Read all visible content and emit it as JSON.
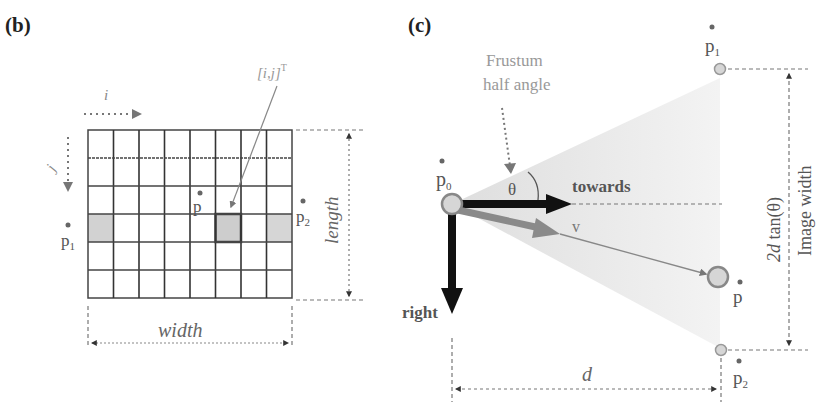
{
  "panels": {
    "b": {
      "label": "(b)",
      "axis_i": "i",
      "axis_j": "j",
      "pixel_label": "[i,j]",
      "pixel_label_sup": "T",
      "point_p": "p",
      "point_p1": "p",
      "point_p1_sub": "1",
      "point_p2": "p",
      "point_p2_sub": "2",
      "dim_width": "width",
      "dim_length": "length",
      "grid": {
        "columns": 8,
        "rows": 6,
        "highlighted_row": 4,
        "highlighted_columns": [
          1,
          6,
          8
        ]
      }
    },
    "c": {
      "label": "(c)",
      "frustum_line1": "Frustum",
      "frustum_line2": "half angle",
      "theta": "θ",
      "towards": "towards",
      "right": "right",
      "v": "v",
      "point_p0": "p",
      "point_p0_sub": "0",
      "point_p": "p",
      "point_p1": "p",
      "point_p1_sub": "1",
      "point_p2": "p",
      "point_p2_sub": "2",
      "dim_d": "d",
      "dim_formula_2d": "2d",
      "dim_formula_tan": " tan(θ)",
      "dim_image_width": "Image width"
    }
  },
  "colors": {
    "grid_line": "#3a3a3a",
    "highlight_fill": "#cfcfcf",
    "arrow_black": "#111111",
    "arrow_gray": "#8a8a8a",
    "frustum_fill": "#e6e6e6",
    "label_gray": "#888888"
  }
}
